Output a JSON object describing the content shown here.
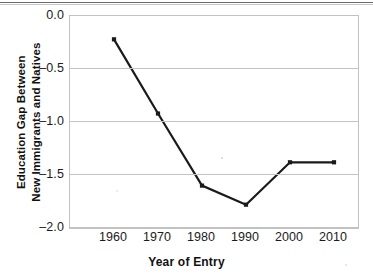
{
  "chart_data": {
    "type": "line",
    "title": "",
    "xlabel": "Year of Entry",
    "ylabel": "Education Gap Between New Immigrants and Natives",
    "ylabel_lines": [
      "Education Gap Between",
      "New Immigrants and Natives"
    ],
    "categories": [
      1960,
      1970,
      1980,
      1990,
      2000,
      2010
    ],
    "x": [
      1960,
      1970,
      1980,
      1990,
      2000,
      2010
    ],
    "values": [
      -0.22,
      -0.92,
      -1.6,
      -1.78,
      -1.38,
      -1.38
    ],
    "series": [
      {
        "name": "Education gap",
        "values": [
          -0.22,
          -0.92,
          -1.6,
          -1.78,
          -1.38,
          -1.38
        ],
        "color": "#1a1a1a",
        "marker": "square"
      }
    ],
    "xtick_labels": [
      "1960",
      "1970",
      "1980",
      "1990",
      "2000",
      "2010"
    ],
    "ytick_labels": [
      "0.0",
      "–0.5",
      "–1.0",
      "–1.5",
      "–2.0"
    ],
    "ytick_values": [
      0.0,
      -0.5,
      -1.0,
      -1.5,
      -2.0
    ],
    "ylim": [
      -2.0,
      0.0
    ],
    "xlim": [
      1955,
      2020
    ],
    "grid": "horizontal",
    "legend": "none",
    "line_color": "#1a1a1a",
    "grid_color": "#c2c2c2",
    "background": "#ffffff"
  }
}
